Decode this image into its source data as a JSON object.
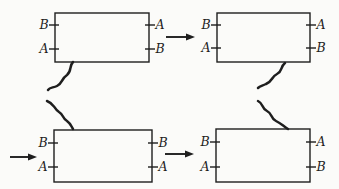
{
  "figure": {
    "width": 339,
    "height": 189,
    "background_color": "#fbfbf9",
    "stroke_color": "#1e1e1e",
    "label_font_size": 12.5,
    "label_offset": 11,
    "tick_inner": 4,
    "tick_outer": 6,
    "boxes": [
      {
        "name": "box-top-left",
        "x": 55,
        "y": 13,
        "width": 94,
        "height": 49,
        "ticks_y": [
          25,
          49
        ],
        "left_labels": [
          "B",
          "A"
        ],
        "right_labels": [
          "A",
          "B"
        ]
      },
      {
        "name": "box-top-right",
        "x": 217,
        "y": 13,
        "width": 93,
        "height": 49,
        "ticks_y": [
          25,
          48
        ],
        "left_labels": [
          "B",
          "A"
        ],
        "right_labels": [
          "A",
          "B"
        ]
      },
      {
        "name": "box-bottom-left",
        "x": 54,
        "y": 130,
        "width": 98,
        "height": 52,
        "ticks_y": [
          143,
          167
        ],
        "left_labels": [
          "B",
          "A"
        ],
        "right_labels": [
          "B",
          "A"
        ]
      },
      {
        "name": "box-bottom-right",
        "x": 216,
        "y": 129,
        "width": 94,
        "height": 53,
        "ticks_y": [
          142,
          167
        ],
        "left_labels": [
          "B",
          "A"
        ],
        "right_labels": [
          "A",
          "B"
        ]
      }
    ],
    "arrows": [
      {
        "name": "arrow-top-middle",
        "x1": 166,
        "y1": 37,
        "x2": 195,
        "y2": 37
      },
      {
        "name": "arrow-left-edge",
        "x1": 10,
        "y1": 157,
        "x2": 37,
        "y2": 157
      },
      {
        "name": "arrow-bottom-middle",
        "x1": 165,
        "y1": 154,
        "x2": 194,
        "y2": 154
      }
    ],
    "squiggles": [
      {
        "name": "squiggle-left-upper",
        "path": "M 73 62 C 69 66, 72 71, 67 75 C 61 79, 63 83, 57 86 C 53 88, 50 87, 48 90"
      },
      {
        "name": "squiggle-left-lower",
        "path": "M 47 101 C 55 104, 53 108, 59 112 C 64 115, 62 118, 67 121 C 71 124, 71 126, 73 129"
      },
      {
        "name": "squiggle-right-upper",
        "path": "M 285 63 C 280 67, 283 71, 277 74 C 271 77, 273 81, 266 84 C 262 86, 260 86, 258 88"
      },
      {
        "name": "squiggle-right-lower",
        "path": "M 258 101 C 264 104, 261 108, 267 111 C 273 114, 270 118, 276 121 C 282 124, 283 126, 288 129"
      }
    ]
  }
}
